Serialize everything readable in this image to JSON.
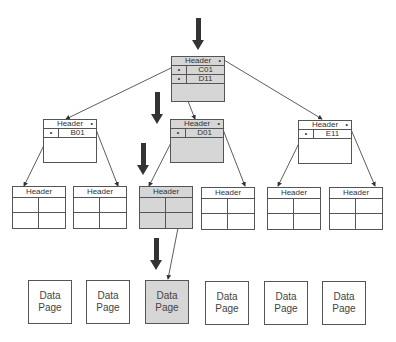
{
  "diagram": {
    "type": "b-tree index traversal",
    "highlight_color": "#d6d6d6",
    "root": {
      "header": "Header",
      "keys": [
        "C01",
        "D11"
      ],
      "highlighted": true
    },
    "intermediate": [
      {
        "header": "Header",
        "keys": [
          "B01"
        ],
        "highlighted": false
      },
      {
        "header": "Header",
        "keys": [
          "D01"
        ],
        "highlighted": true
      },
      {
        "header": "Header",
        "keys": [
          "E11"
        ],
        "highlighted": false
      }
    ],
    "leaves": [
      {
        "header": "Header",
        "highlighted": false
      },
      {
        "header": "Header",
        "highlighted": false
      },
      {
        "header": "Header",
        "highlighted": true
      },
      {
        "header": "Header",
        "highlighted": false
      },
      {
        "header": "Header",
        "highlighted": false
      },
      {
        "header": "Header",
        "highlighted": false
      }
    ],
    "data_pages": [
      {
        "line1": "Data",
        "line2": "Page",
        "highlighted": false
      },
      {
        "line1": "Data",
        "line2": "Page",
        "highlighted": false
      },
      {
        "line1": "Data",
        "line2": "Page",
        "highlighted": true
      },
      {
        "line1": "Data",
        "line2": "Page",
        "highlighted": false
      },
      {
        "line1": "Data",
        "line2": "Page",
        "highlighted": false
      },
      {
        "line1": "Data",
        "line2": "Page",
        "highlighted": false
      }
    ],
    "pointer_dot": "•",
    "traversal_arrows": 4
  }
}
